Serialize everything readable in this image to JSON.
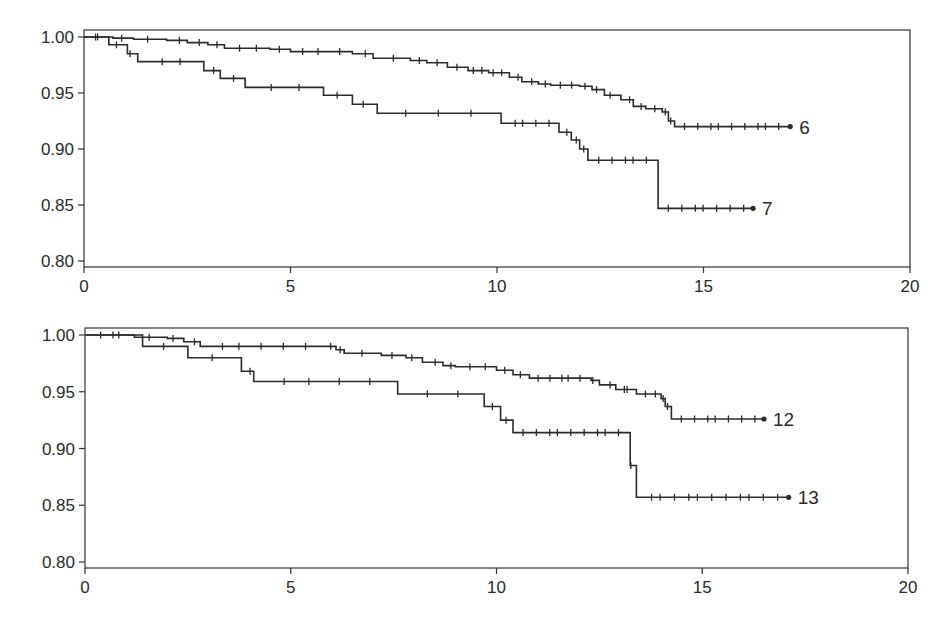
{
  "chart_data": [
    {
      "type": "line",
      "subtype": "kaplan-meier-step",
      "title": "",
      "xlabel": "",
      "ylabel": "",
      "xlim": [
        0,
        20
      ],
      "ylim": [
        0.8,
        1.0
      ],
      "x_ticks": [
        0,
        5,
        10,
        15,
        20
      ],
      "x_tick_labels": [
        "0",
        "5",
        "10",
        "15",
        "20"
      ],
      "y_ticks": [
        0.8,
        0.85,
        0.9,
        0.95,
        1.0
      ],
      "y_tick_labels": [
        "0.80",
        "0.85",
        "0.90",
        "0.95",
        "1.00"
      ],
      "grid": false,
      "legend": "inline labels at curve ends",
      "series": [
        {
          "name": "6",
          "steps": [
            [
              0,
              1.0
            ],
            [
              0.7,
              0.999
            ],
            [
              1.2,
              0.998
            ],
            [
              2.0,
              0.997
            ],
            [
              2.5,
              0.995
            ],
            [
              3.0,
              0.993
            ],
            [
              3.4,
              0.99
            ],
            [
              4.5,
              0.989
            ],
            [
              5.0,
              0.987
            ],
            [
              6.0,
              0.987
            ],
            [
              6.5,
              0.985
            ],
            [
              7.0,
              0.981
            ],
            [
              7.9,
              0.979
            ],
            [
              8.3,
              0.977
            ],
            [
              8.8,
              0.973
            ],
            [
              9.3,
              0.97
            ],
            [
              9.8,
              0.968
            ],
            [
              10.3,
              0.964
            ],
            [
              10.6,
              0.96
            ],
            [
              11.0,
              0.958
            ],
            [
              11.3,
              0.957
            ],
            [
              12.0,
              0.956
            ],
            [
              12.3,
              0.953
            ],
            [
              12.6,
              0.948
            ],
            [
              13.0,
              0.944
            ],
            [
              13.3,
              0.938
            ],
            [
              13.6,
              0.936
            ],
            [
              14.0,
              0.933
            ],
            [
              14.15,
              0.925
            ],
            [
              14.3,
              0.92
            ],
            [
              17.1,
              0.92
            ]
          ],
          "censor_marks_dense_from": 9.0,
          "end_label": "6"
        },
        {
          "name": "7",
          "steps": [
            [
              0,
              1.0
            ],
            [
              0.6,
              0.993
            ],
            [
              1.05,
              0.985
            ],
            [
              1.3,
              0.978
            ],
            [
              2.9,
              0.97
            ],
            [
              3.3,
              0.963
            ],
            [
              3.9,
              0.955
            ],
            [
              5.8,
              0.948
            ],
            [
              6.5,
              0.94
            ],
            [
              7.1,
              0.932
            ],
            [
              10.1,
              0.923
            ],
            [
              11.5,
              0.915
            ],
            [
              11.8,
              0.908
            ],
            [
              12.0,
              0.9
            ],
            [
              12.2,
              0.89
            ],
            [
              13.9,
              0.847
            ],
            [
              16.2,
              0.847
            ]
          ],
          "end_label": "7"
        }
      ]
    },
    {
      "type": "line",
      "subtype": "kaplan-meier-step",
      "title": "",
      "xlabel": "",
      "ylabel": "",
      "xlim": [
        0,
        20
      ],
      "ylim": [
        0.8,
        1.0
      ],
      "x_ticks": [
        0,
        5,
        10,
        15,
        20
      ],
      "x_tick_labels": [
        "0",
        "5",
        "10",
        "15",
        "20"
      ],
      "y_ticks": [
        0.8,
        0.85,
        0.9,
        0.95,
        1.0
      ],
      "y_tick_labels": [
        "0.80",
        "0.85",
        "0.90",
        "0.95",
        "1.00"
      ],
      "grid": false,
      "legend": "inline labels at curve ends",
      "series": [
        {
          "name": "12",
          "steps": [
            [
              0,
              1.0
            ],
            [
              1.2,
              0.998
            ],
            [
              2.0,
              0.997
            ],
            [
              2.4,
              0.994
            ],
            [
              2.8,
              0.99
            ],
            [
              5.8,
              0.99
            ],
            [
              6.1,
              0.987
            ],
            [
              6.3,
              0.984
            ],
            [
              7.2,
              0.982
            ],
            [
              7.8,
              0.98
            ],
            [
              8.2,
              0.976
            ],
            [
              8.7,
              0.973
            ],
            [
              9.0,
              0.972
            ],
            [
              10.0,
              0.969
            ],
            [
              10.4,
              0.965
            ],
            [
              10.8,
              0.962
            ],
            [
              12.3,
              0.96
            ],
            [
              12.5,
              0.956
            ],
            [
              12.9,
              0.952
            ],
            [
              13.4,
              0.948
            ],
            [
              14.0,
              0.944
            ],
            [
              14.1,
              0.937
            ],
            [
              14.25,
              0.926
            ],
            [
              16.5,
              0.926
            ]
          ],
          "end_label": "12"
        },
        {
          "name": "13",
          "steps": [
            [
              0,
              1.0
            ],
            [
              1.4,
              0.99
            ],
            [
              2.5,
              0.98
            ],
            [
              3.8,
              0.968
            ],
            [
              4.1,
              0.959
            ],
            [
              7.6,
              0.948
            ],
            [
              9.7,
              0.937
            ],
            [
              10.1,
              0.925
            ],
            [
              10.4,
              0.914
            ],
            [
              13.25,
              0.885
            ],
            [
              13.4,
              0.857
            ],
            [
              17.1,
              0.857
            ]
          ],
          "end_label": "13"
        }
      ]
    }
  ],
  "colors": {
    "line": "#2b2b2b",
    "axis": "#333333",
    "background": "#ffffff"
  }
}
